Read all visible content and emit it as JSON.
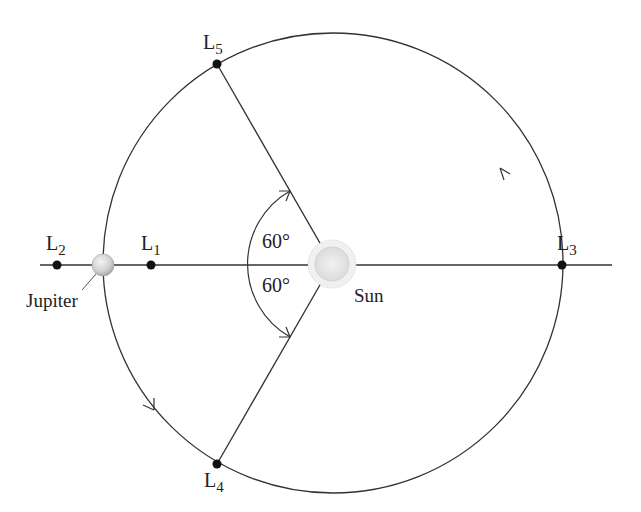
{
  "diagram": {
    "bodies": {
      "sun": {
        "label": "Sun"
      },
      "jupiter": {
        "label": "Jupiter"
      }
    },
    "points": [
      {
        "id": "L1",
        "main": "L",
        "sub": "1"
      },
      {
        "id": "L2",
        "main": "L",
        "sub": "2"
      },
      {
        "id": "L3",
        "main": "L",
        "sub": "3"
      },
      {
        "id": "L4",
        "main": "L",
        "sub": "4"
      },
      {
        "id": "L5",
        "main": "L",
        "sub": "5"
      }
    ],
    "angles": [
      {
        "label": "60°",
        "position": "upper"
      },
      {
        "label": "60°",
        "position": "lower"
      }
    ],
    "orbit_direction": "counterclockwise",
    "colors": {
      "line": "#333333",
      "point": "#111111",
      "sun_fill": "#e8e8e8",
      "jupiter_fill": "#cfcfcf"
    }
  }
}
